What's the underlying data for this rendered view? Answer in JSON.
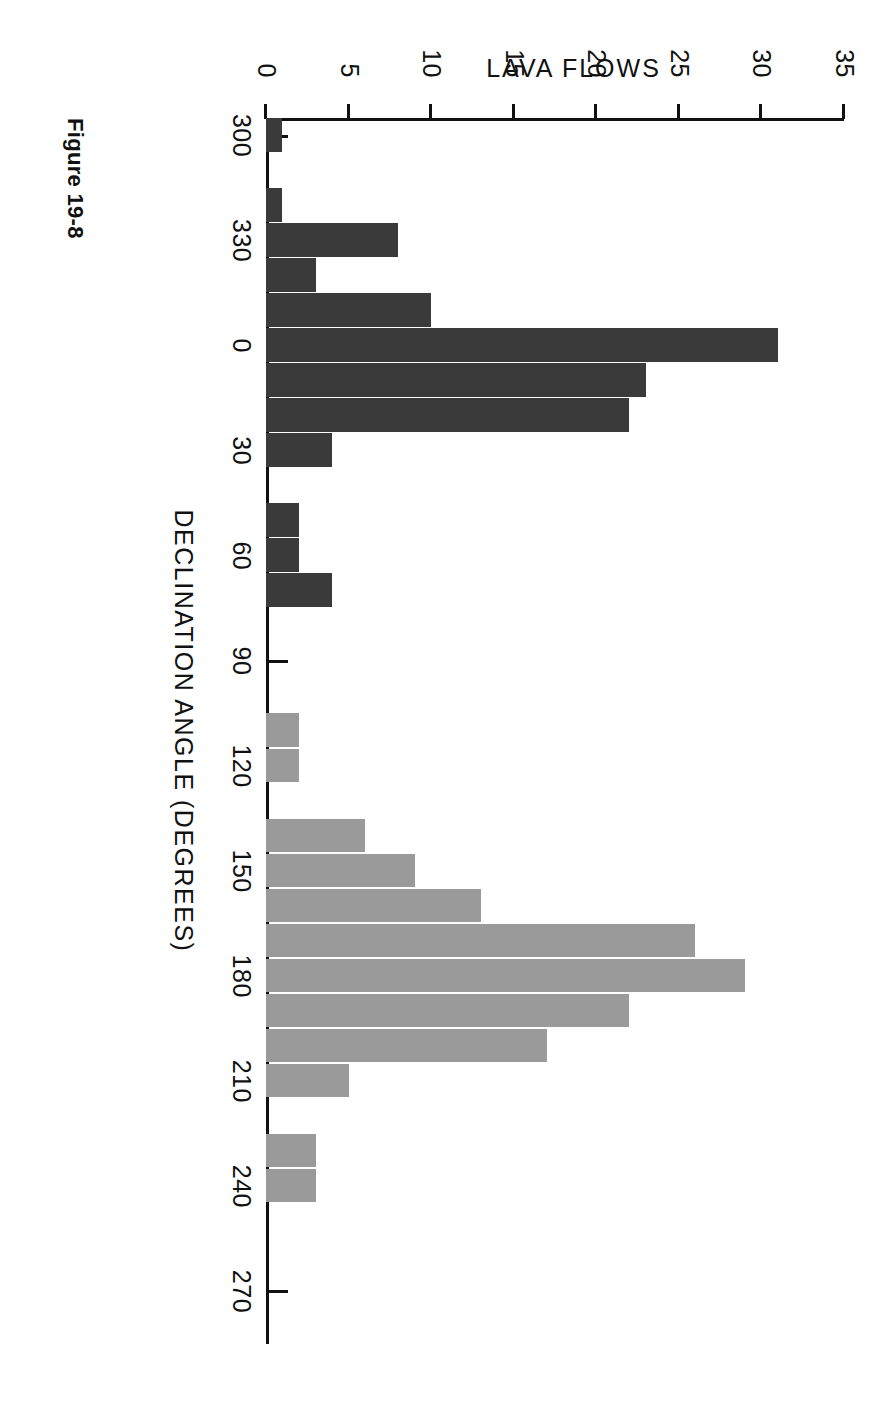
{
  "figure": {
    "caption": "Figure 19-8"
  },
  "chart_data": {
    "type": "bar",
    "title": "",
    "xlabel": "DECLINATION ANGLE (DEGREES)",
    "ylabel": "LAVA FLOWS",
    "grid": false,
    "legend": "none",
    "bin_width_degrees": 10,
    "xtick_labels": [
      "300",
      "330",
      "0",
      "30",
      "60",
      "90",
      "120",
      "150",
      "180",
      "210",
      "240",
      "270"
    ],
    "xtick_values": [
      300,
      330,
      0,
      30,
      60,
      90,
      120,
      150,
      180,
      210,
      240,
      270
    ],
    "ytick_labels": [
      "0",
      "5",
      "10",
      "15",
      "20",
      "25",
      "30",
      "35"
    ],
    "ytick_values": [
      0,
      5,
      10,
      15,
      20,
      25,
      30,
      35
    ],
    "ylim": [
      0,
      35
    ],
    "xlim_degrees": [
      290,
      290
    ],
    "colors": {
      "normal_polarity_bar": "#3a3a3a",
      "reversed_polarity_bar": "#9a9a9a",
      "axis": "#111111",
      "background": "#ffffff"
    },
    "bars": [
      {
        "bin_start": 295,
        "center": 300,
        "value": 1,
        "group": "normal"
      },
      {
        "bin_start": 305,
        "center": 310,
        "value": 0,
        "group": "normal"
      },
      {
        "bin_start": 315,
        "center": 320,
        "value": 1,
        "group": "normal"
      },
      {
        "bin_start": 325,
        "center": 330,
        "value": 8,
        "group": "normal"
      },
      {
        "bin_start": 335,
        "center": 340,
        "value": 3,
        "group": "normal"
      },
      {
        "bin_start": 345,
        "center": 350,
        "value": 10,
        "group": "normal"
      },
      {
        "bin_start": 355,
        "center": 0,
        "value": 31,
        "group": "normal"
      },
      {
        "bin_start": 5,
        "center": 10,
        "value": 23,
        "group": "normal"
      },
      {
        "bin_start": 15,
        "center": 20,
        "value": 22,
        "group": "normal"
      },
      {
        "bin_start": 25,
        "center": 30,
        "value": 4,
        "group": "normal"
      },
      {
        "bin_start": 35,
        "center": 40,
        "value": 0,
        "group": "normal"
      },
      {
        "bin_start": 45,
        "center": 50,
        "value": 2,
        "group": "normal"
      },
      {
        "bin_start": 55,
        "center": 60,
        "value": 2,
        "group": "normal"
      },
      {
        "bin_start": 65,
        "center": 70,
        "value": 4,
        "group": "normal"
      },
      {
        "bin_start": 75,
        "center": 80,
        "value": 0,
        "group": "normal"
      },
      {
        "bin_start": 85,
        "center": 90,
        "value": 0,
        "group": "normal"
      },
      {
        "bin_start": 95,
        "center": 100,
        "value": 0,
        "group": "reversed"
      },
      {
        "bin_start": 105,
        "center": 110,
        "value": 2,
        "group": "reversed"
      },
      {
        "bin_start": 115,
        "center": 120,
        "value": 2,
        "group": "reversed"
      },
      {
        "bin_start": 125,
        "center": 130,
        "value": 0,
        "group": "reversed"
      },
      {
        "bin_start": 135,
        "center": 140,
        "value": 6,
        "group": "reversed"
      },
      {
        "bin_start": 145,
        "center": 150,
        "value": 9,
        "group": "reversed"
      },
      {
        "bin_start": 155,
        "center": 160,
        "value": 13,
        "group": "reversed"
      },
      {
        "bin_start": 165,
        "center": 170,
        "value": 26,
        "group": "reversed"
      },
      {
        "bin_start": 175,
        "center": 180,
        "value": 29,
        "group": "reversed"
      },
      {
        "bin_start": 185,
        "center": 190,
        "value": 22,
        "group": "reversed"
      },
      {
        "bin_start": 195,
        "center": 200,
        "value": 17,
        "group": "reversed"
      },
      {
        "bin_start": 205,
        "center": 210,
        "value": 5,
        "group": "reversed"
      },
      {
        "bin_start": 215,
        "center": 220,
        "value": 0,
        "group": "reversed"
      },
      {
        "bin_start": 225,
        "center": 230,
        "value": 3,
        "group": "reversed"
      },
      {
        "bin_start": 235,
        "center": 240,
        "value": 3,
        "group": "reversed"
      },
      {
        "bin_start": 245,
        "center": 250,
        "value": 0,
        "group": "reversed"
      },
      {
        "bin_start": 255,
        "center": 260,
        "value": 0,
        "group": "reversed"
      },
      {
        "bin_start": 265,
        "center": 270,
        "value": 0,
        "group": "reversed"
      },
      {
        "bin_start": 275,
        "center": 280,
        "value": 0,
        "group": "reversed"
      }
    ]
  }
}
